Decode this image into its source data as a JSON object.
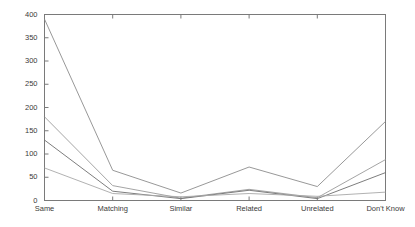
{
  "chart_data": {
    "type": "line",
    "title": "",
    "xlabel": "",
    "ylabel": "",
    "categories": [
      "Same",
      "Matching",
      "Similar",
      "Related",
      "Unrelated",
      "Don't Know"
    ],
    "ylim": [
      0,
      400
    ],
    "yticks": [
      0,
      50,
      100,
      150,
      200,
      250,
      300,
      350,
      400
    ],
    "ytick_labels": [
      "0",
      "50",
      "100",
      "150",
      "200",
      "250",
      "300",
      "350",
      "400"
    ],
    "grid": false,
    "legend": "none",
    "series": [
      {
        "name": "series-1",
        "color": "#8c8c8c",
        "values": [
          390,
          65,
          16,
          72,
          30,
          170
        ]
      },
      {
        "name": "series-2",
        "color": "#9a9a9a",
        "values": [
          180,
          32,
          5,
          24,
          6,
          88
        ]
      },
      {
        "name": "series-3",
        "color": "#6e6e6e",
        "values": [
          130,
          20,
          4,
          22,
          4,
          60
        ]
      },
      {
        "name": "series-4",
        "color": "#a8a8a8",
        "values": [
          70,
          15,
          8,
          15,
          9,
          18
        ]
      }
    ]
  },
  "axes": {
    "frame_color": "#7a7a7a",
    "tick_color": "#7a7a7a",
    "text_color": "#3a3a3a"
  }
}
